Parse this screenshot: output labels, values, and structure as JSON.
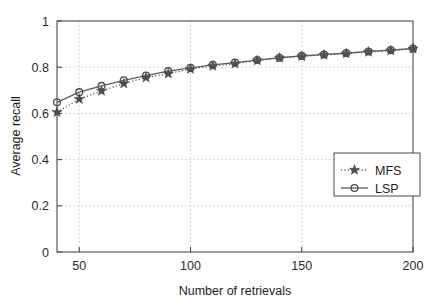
{
  "chart_data": {
    "type": "line",
    "title": "",
    "xlabel": "Number of retrievals",
    "ylabel": "Average recall",
    "xlim": [
      40,
      200
    ],
    "ylim": [
      0,
      1
    ],
    "xticks": [
      50,
      100,
      150,
      200
    ],
    "xticklabels": [
      "50",
      "100",
      "150",
      "200"
    ],
    "yticks": [
      0,
      0.2,
      0.4,
      0.6,
      0.8,
      1
    ],
    "yticklabels": [
      "0",
      "0.2",
      "0.4",
      "0.6",
      "0.8",
      "1"
    ],
    "grid": true,
    "legend_position": "lower right",
    "x": [
      40,
      50,
      60,
      70,
      80,
      90,
      100,
      110,
      120,
      130,
      140,
      150,
      160,
      170,
      180,
      190,
      200
    ],
    "series": [
      {
        "name": "MFS",
        "marker": "star",
        "linestyle": "dotted",
        "color": "#4d4d4d",
        "values": [
          0.605,
          0.662,
          0.697,
          0.729,
          0.755,
          0.772,
          0.792,
          0.805,
          0.815,
          0.829,
          0.84,
          0.847,
          0.853,
          0.859,
          0.866,
          0.872,
          0.879
        ]
      },
      {
        "name": "LSP",
        "marker": "circle",
        "linestyle": "solid",
        "color": "#4d4d4d",
        "values": [
          0.648,
          0.692,
          0.719,
          0.743,
          0.764,
          0.783,
          0.797,
          0.81,
          0.82,
          0.831,
          0.841,
          0.849,
          0.855,
          0.861,
          0.868,
          0.874,
          0.881
        ]
      }
    ]
  },
  "legend": {
    "entries": [
      {
        "label": "MFS"
      },
      {
        "label": "LSP"
      }
    ]
  }
}
